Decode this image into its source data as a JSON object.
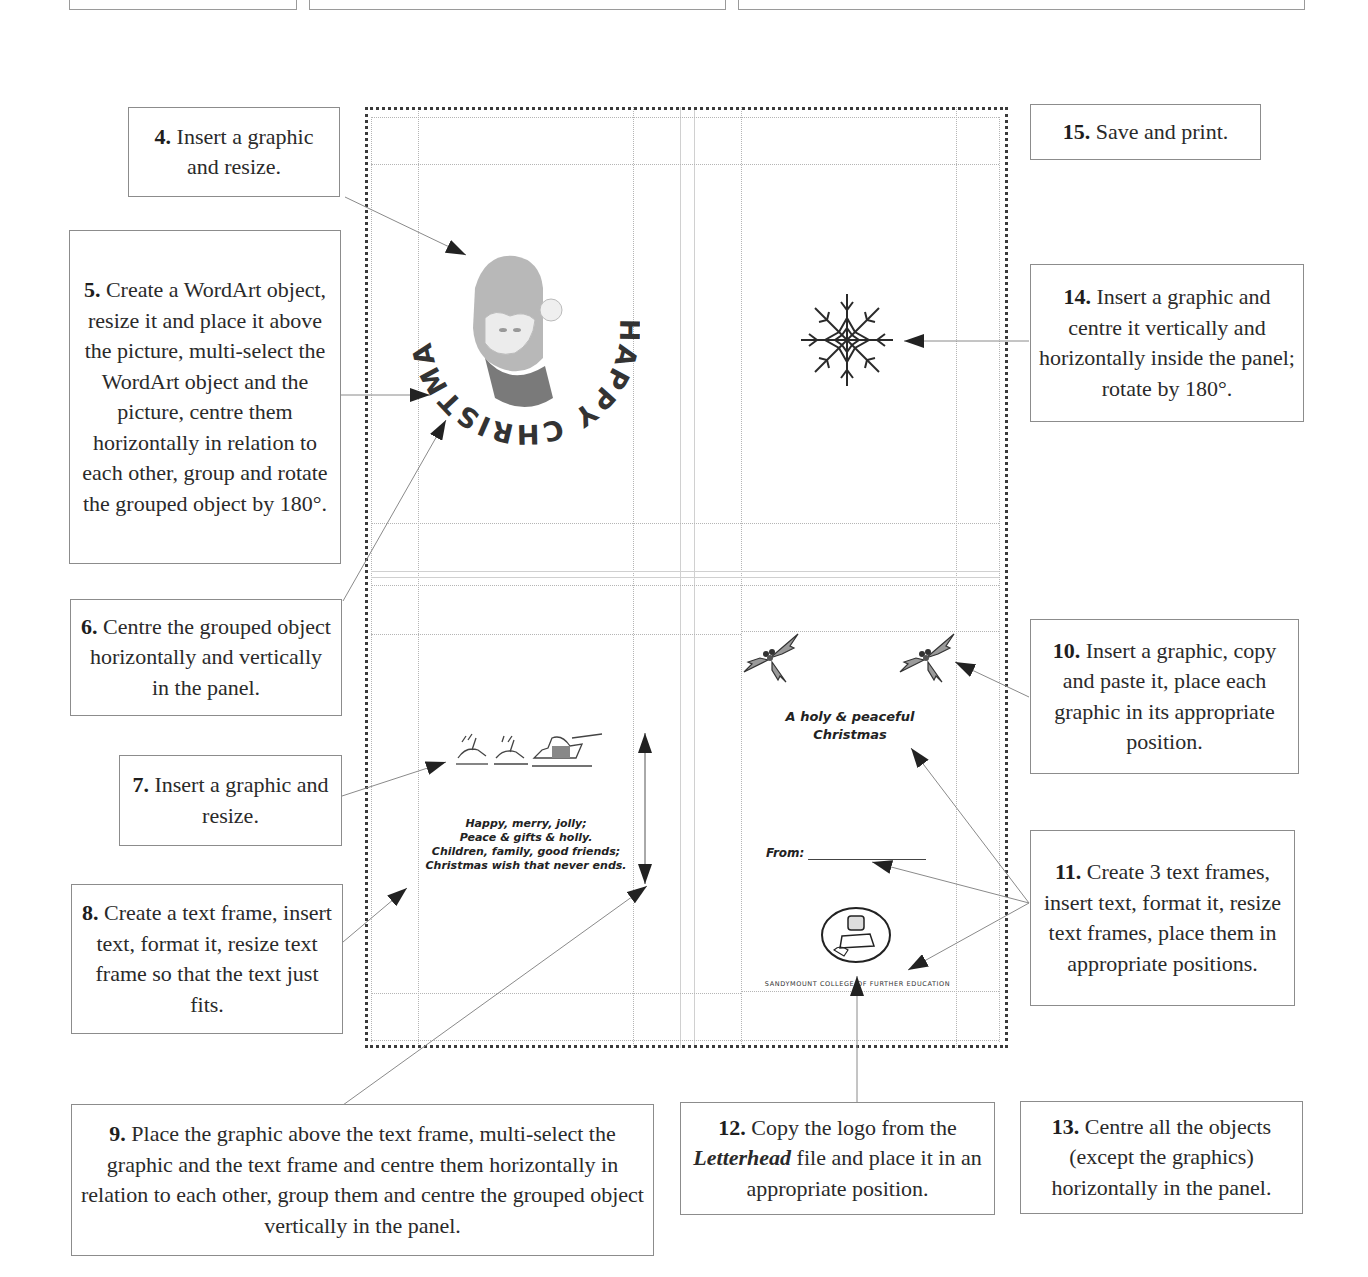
{
  "steps": {
    "s4": {
      "num": "4.",
      "text": " Insert a graphic and resize."
    },
    "s5": {
      "num": "5.",
      "text": " Create a WordArt object, resize it and place it above the picture, multi-select the WordArt object and the picture, centre them horizontally in relation to each other, group and rotate the grouped object by 180°."
    },
    "s6": {
      "num": "6.",
      "text": " Centre the grouped object horizontally and vertically in the panel."
    },
    "s7": {
      "num": "7.",
      "text": " Insert a graphic and resize."
    },
    "s8": {
      "num": "8.",
      "text": " Create a text frame, insert text, format it, resize text frame so that the text just fits."
    },
    "s9": {
      "num": "9.",
      "text": " Place the graphic above the text frame, multi-select the graphic and the text frame and centre them horizontally in relation to each other, group them and centre the grouped object vertically in the panel."
    },
    "s10": {
      "num": "10.",
      "text": " Insert a graphic, copy and paste it, place each graphic in its appropriate position."
    },
    "s11": {
      "num": "11.",
      "text": " Create 3 text frames, insert text, format it, resize text frames, place them in appropriate positions."
    },
    "s12": {
      "num": "12.",
      "text_before": " Copy the logo from the ",
      "emphasis": "Letterhead",
      "text_after": " file and place it in an appropriate position."
    },
    "s13": {
      "num": "13.",
      "text": " Centre all the objects (except the graphics) horizontally in the panel."
    },
    "s14": {
      "num": "14.",
      "text": " Insert a graphic and centre it vertically and horizontally inside the panel; rotate by 180°."
    },
    "s15": {
      "num": "15.",
      "text": " Save and print."
    }
  },
  "card": {
    "wordart_text": "HAPPY CHRISTMAS",
    "poem": [
      "Happy, merry, jolly;",
      "Peace & gifts & holly.",
      "Children, family, good friends;",
      "Christmas wish that never ends."
    ],
    "greeting": [
      "A holy & peaceful",
      "Christmas"
    ],
    "from_label": "From:",
    "college_name": "SANDYMOUNT COLLEGE OF FURTHER EDUCATION"
  },
  "colors": {
    "box_border": "#8c8c8c",
    "guide": "#b5b5b5",
    "frame_dots": "#3a3a3a",
    "arrow": "#222222"
  }
}
